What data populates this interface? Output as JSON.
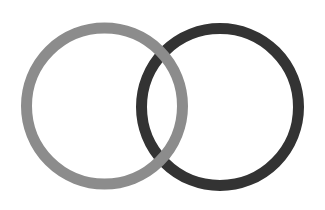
{
  "diagram": {
    "type": "interlocking-rings",
    "background": "#ffffff",
    "rings": [
      {
        "id": "left-ring",
        "color": "#8c8c8c",
        "cx": 104.5,
        "cy": 106,
        "r": 78,
        "stroke_width": 11,
        "layer": "top"
      },
      {
        "id": "right-ring",
        "color": "#333333",
        "cx": 220,
        "cy": 107,
        "r": 78.5,
        "stroke_width": 11,
        "layer": "bottom"
      }
    ]
  }
}
